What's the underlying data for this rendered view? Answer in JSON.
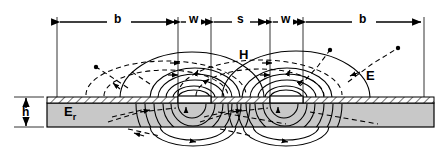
{
  "diagram": {
    "top_dimensions": [
      {
        "key": "b_left",
        "label": "b",
        "x0": 57,
        "x1": 178
      },
      {
        "key": "w_left",
        "label": "w",
        "x0": 178,
        "x1": 211
      },
      {
        "key": "s",
        "label": "s",
        "x0": 211,
        "x1": 270
      },
      {
        "key": "w_right",
        "label": "w",
        "x0": 270,
        "x1": 303
      },
      {
        "key": "b_right",
        "label": "b",
        "x0": 303,
        "x1": 424
      }
    ],
    "side_dimension": {
      "key": "h",
      "label": "h",
      "y0": 97,
      "y1": 127
    },
    "field_labels": [
      {
        "key": "H",
        "label": "H",
        "x": 243,
        "y": 55,
        "meaning": "magnetic-field"
      },
      {
        "key": "E",
        "label": "E",
        "x": 370,
        "y": 76,
        "meaning": "electric-field"
      }
    ],
    "substrate": {
      "label": "E",
      "subscript": "r",
      "meaning": "relative-permittivity",
      "x": 68,
      "y": 111,
      "fill": "#c8c8c8",
      "x0": 47,
      "x1": 434,
      "y_top": 97,
      "y_bottom": 127
    },
    "conductors": [
      {
        "key": "strip-left",
        "x0": 178,
        "x1": 211
      },
      {
        "key": "strip-right",
        "x0": 270,
        "x1": 303
      }
    ],
    "ground_planes": [
      {
        "key": "ground-left",
        "x0": 47,
        "x1": 178
      },
      {
        "key": "ground-center",
        "x0": 211,
        "x1": 270
      },
      {
        "key": "ground-right",
        "x0": 303,
        "x1": 434
      }
    ],
    "legend": {
      "e_field_style": "solid",
      "h_field_style": "dashed"
    },
    "colors": {
      "line": "#000000",
      "substrate_fill": "#c8c8c8",
      "substrate_edge": "#000000",
      "conductor_fill": "#ffffff",
      "background": "#ffffff"
    }
  }
}
